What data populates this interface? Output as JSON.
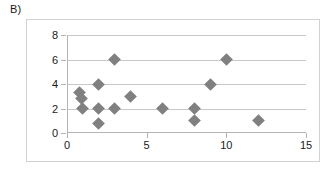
{
  "panel": {
    "label": "B)"
  },
  "chart_data": {
    "type": "scatter",
    "title": "",
    "xlabel": "",
    "ylabel": "",
    "xlim": [
      0,
      15
    ],
    "ylim": [
      0,
      8
    ],
    "xticks": [
      0,
      5,
      10,
      15
    ],
    "yticks": [
      0,
      2,
      4,
      6,
      8
    ],
    "xtick_labels": [
      "0",
      "5",
      "10",
      "15"
    ],
    "ytick_labels": [
      "0",
      "2",
      "4",
      "6",
      "8"
    ],
    "grid": "horizontal",
    "legend": "none",
    "marker": "diamond",
    "marker_color": "#808080",
    "points": [
      {
        "x": 0.8,
        "y": 3.3
      },
      {
        "x": 0.9,
        "y": 2.8
      },
      {
        "x": 1.0,
        "y": 2.0
      },
      {
        "x": 2.0,
        "y": 4.0
      },
      {
        "x": 2.0,
        "y": 2.0
      },
      {
        "x": 2.0,
        "y": 0.8
      },
      {
        "x": 3.0,
        "y": 6.0
      },
      {
        "x": 3.0,
        "y": 2.0
      },
      {
        "x": 4.0,
        "y": 3.0
      },
      {
        "x": 6.0,
        "y": 2.0
      },
      {
        "x": 8.0,
        "y": 2.0
      },
      {
        "x": 8.0,
        "y": 1.0
      },
      {
        "x": 9.0,
        "y": 4.0
      },
      {
        "x": 10.0,
        "y": 6.0
      },
      {
        "x": 12.0,
        "y": 1.0
      }
    ]
  }
}
